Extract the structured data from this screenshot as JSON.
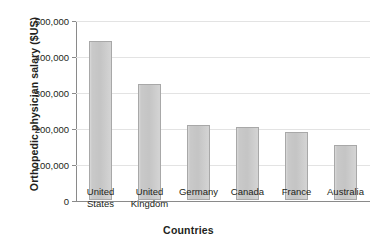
{
  "chart_data": {
    "type": "bar",
    "title": "",
    "xlabel": "Countries",
    "ylabel": "Orthopedic physician salary ($US)",
    "categories": [
      "United States",
      "United Kingdom",
      "Germany",
      "Canada",
      "France",
      "Australia"
    ],
    "category_lines": [
      [
        "United",
        "States"
      ],
      [
        "United",
        "Kingdom"
      ],
      [
        "Germany",
        ""
      ],
      [
        "Canada",
        ""
      ],
      [
        "France",
        ""
      ],
      [
        "Australia",
        ""
      ]
    ],
    "values": [
      442000,
      322000,
      209000,
      203000,
      188000,
      153000
    ],
    "ylim": [
      0,
      500000
    ],
    "yticks": [
      0,
      100000,
      200000,
      300000,
      400000,
      500000
    ],
    "ytick_labels": [
      "0",
      "100,000",
      "200,000",
      "300,000",
      "400,000",
      "500,000"
    ],
    "grid": true,
    "legend": "none",
    "colors": {
      "bar_fill": "#c9c9c9",
      "bar_border": "#a8a8a8",
      "gridline": "#e3e3e3",
      "axis": "#8a8a8a",
      "text": "#231f20",
      "background": "#ffffff"
    }
  }
}
